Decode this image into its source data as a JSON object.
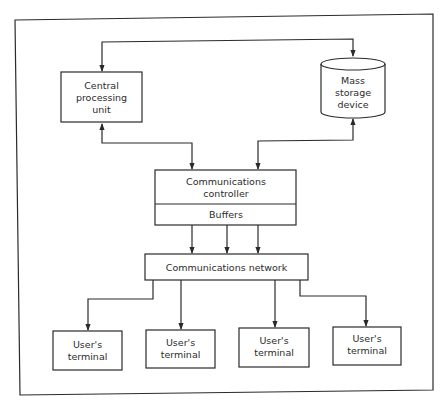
{
  "diagram": {
    "type": "block-diagram",
    "frame": {
      "stroke": "#2a2a2a",
      "background": "#ffffff"
    },
    "nodes": {
      "cpu": {
        "lines": [
          "Central",
          "processing",
          "unit"
        ],
        "shape": "rectangle"
      },
      "storage": {
        "lines": [
          "Mass",
          "storage",
          "device"
        ],
        "shape": "cylinder"
      },
      "controller": {
        "lines": [
          "Communications",
          "controller"
        ],
        "shape": "rectangle"
      },
      "buffers": {
        "label": "Buffers",
        "shape": "rectangle-section"
      },
      "network": {
        "label": "Communications network",
        "shape": "rectangle"
      },
      "terminals": [
        {
          "lines": [
            "User's",
            "terminal"
          ]
        },
        {
          "lines": [
            "User's",
            "terminal"
          ]
        },
        {
          "lines": [
            "User's",
            "terminal"
          ]
        },
        {
          "lines": [
            "User's",
            "terminal"
          ]
        }
      ]
    },
    "edges": [
      {
        "from": "cpu",
        "to": "storage",
        "direction": "bidirectional"
      },
      {
        "from": "cpu",
        "to": "controller",
        "direction": "bidirectional"
      },
      {
        "from": "storage",
        "to": "controller",
        "direction": "bidirectional"
      },
      {
        "from": "buffers",
        "to": "network",
        "count": 3,
        "direction": "forward"
      },
      {
        "from": "network",
        "to": "terminal-1",
        "direction": "forward"
      },
      {
        "from": "network",
        "to": "terminal-2",
        "direction": "forward"
      },
      {
        "from": "network",
        "to": "terminal-3",
        "direction": "forward"
      },
      {
        "from": "network",
        "to": "terminal-4",
        "direction": "forward"
      }
    ]
  }
}
